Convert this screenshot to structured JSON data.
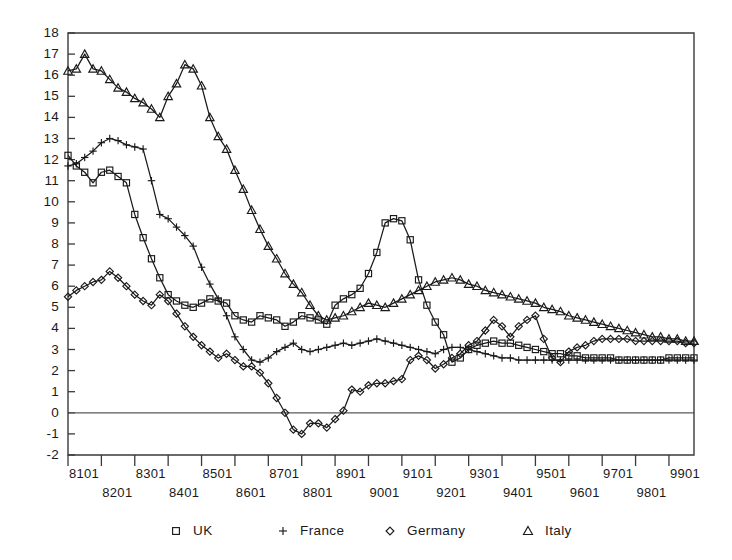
{
  "chart_data": {
    "type": "line",
    "title": "",
    "subtitle": "",
    "xlabel": "",
    "ylabel": "",
    "xlim": [
      0,
      75
    ],
    "ylim": [
      -2,
      18
    ],
    "grid": false,
    "legend_position": "bottom",
    "y_ticks": [
      -2,
      -1,
      0,
      1,
      2,
      3,
      4,
      5,
      6,
      7,
      8,
      9,
      10,
      11,
      12,
      13,
      14,
      15,
      16,
      17,
      18
    ],
    "y_tick_labels": [
      "-2",
      "-1",
      "0",
      "1",
      "2",
      "3",
      "4",
      "5",
      "6",
      "7",
      "8",
      "9",
      "10",
      "11",
      "12",
      "13",
      "14",
      "15",
      "16",
      "17",
      "18"
    ],
    "x_tick_labels_upper": [
      "8101",
      "8301",
      "8501",
      "8701",
      "8901",
      "9101",
      "9301",
      "9501",
      "9701",
      "9901"
    ],
    "x_tick_labels_lower": [
      "8201",
      "8401",
      "8601",
      "8801",
      "9001",
      "9201",
      "9401",
      "9601",
      "9801"
    ],
    "x_tick_index_upper": [
      0,
      8,
      16,
      24,
      32,
      40,
      48,
      56,
      64,
      72
    ],
    "x_tick_index_lower": [
      4,
      12,
      20,
      28,
      36,
      44,
      52,
      60,
      68
    ],
    "zero_line": 0,
    "point_count": 76,
    "series": [
      {
        "name": "UK",
        "marker": "square",
        "values": [
          12.2,
          11.7,
          11.4,
          10.9,
          11.4,
          11.5,
          11.2,
          10.9,
          9.4,
          8.3,
          7.3,
          6.4,
          5.6,
          5.3,
          5.1,
          5.0,
          5.2,
          5.4,
          5.3,
          5.2,
          4.6,
          4.4,
          4.3,
          4.6,
          4.5,
          4.4,
          4.1,
          4.3,
          4.6,
          4.5,
          4.4,
          4.2,
          5.1,
          5.4,
          5.6,
          5.9,
          6.6,
          7.6,
          9.0,
          9.2,
          9.1,
          8.2,
          6.3,
          5.1,
          4.3,
          3.7,
          2.4,
          2.6,
          3.0,
          3.2,
          3.3,
          3.4,
          3.3,
          3.3,
          3.2,
          3.1,
          3.0,
          2.9,
          2.8,
          2.8,
          2.7,
          2.7,
          2.6,
          2.6,
          2.6,
          2.6,
          2.5,
          2.5,
          2.5,
          2.5,
          2.5,
          2.5,
          2.6,
          2.6,
          2.6,
          2.6
        ]
      },
      {
        "name": "France",
        "marker": "plus",
        "values": [
          11.7,
          11.8,
          12.1,
          12.4,
          12.8,
          13.0,
          12.9,
          12.7,
          12.6,
          12.5,
          11.0,
          9.4,
          9.2,
          8.8,
          8.4,
          7.9,
          6.9,
          6.1,
          5.4,
          4.6,
          3.6,
          3.0,
          2.5,
          2.4,
          2.6,
          2.9,
          3.1,
          3.3,
          3.0,
          2.9,
          3.0,
          3.1,
          3.2,
          3.3,
          3.2,
          3.3,
          3.4,
          3.5,
          3.4,
          3.3,
          3.2,
          3.1,
          3.0,
          2.9,
          2.8,
          3.0,
          3.1,
          3.1,
          3.0,
          2.9,
          2.8,
          2.7,
          2.6,
          2.6,
          2.5,
          2.5,
          2.5,
          2.5,
          2.5,
          2.5,
          2.5,
          2.5,
          2.5,
          2.5,
          2.5,
          2.5,
          2.5,
          2.5,
          2.5,
          2.5,
          2.5,
          2.5,
          2.5,
          2.5,
          2.5,
          2.5
        ]
      },
      {
        "name": "Germany",
        "marker": "diamond",
        "values": [
          5.5,
          5.8,
          6.0,
          6.2,
          6.3,
          6.7,
          6.4,
          6.0,
          5.6,
          5.3,
          5.1,
          5.6,
          5.3,
          4.7,
          4.1,
          3.6,
          3.2,
          2.9,
          2.6,
          2.8,
          2.5,
          2.2,
          2.2,
          1.9,
          1.4,
          0.7,
          0.0,
          -0.8,
          -1.0,
          -0.5,
          -0.5,
          -0.7,
          -0.3,
          0.1,
          1.1,
          1.0,
          1.3,
          1.4,
          1.4,
          1.5,
          1.6,
          2.5,
          2.7,
          2.5,
          2.1,
          2.3,
          2.6,
          2.8,
          3.2,
          3.4,
          3.9,
          4.4,
          4.1,
          3.6,
          4.1,
          4.4,
          4.6,
          3.5,
          2.6,
          2.4,
          2.9,
          3.1,
          3.2,
          3.4,
          3.5,
          3.5,
          3.5,
          3.5,
          3.4,
          3.4,
          3.4,
          3.4,
          3.4,
          3.4,
          3.3,
          3.3
        ]
      },
      {
        "name": "Italy",
        "marker": "triangle",
        "values": [
          16.2,
          16.3,
          17.0,
          16.3,
          16.2,
          15.8,
          15.4,
          15.2,
          14.9,
          14.7,
          14.4,
          14.0,
          15.0,
          15.6,
          16.5,
          16.3,
          15.5,
          14.0,
          13.1,
          12.5,
          11.5,
          10.6,
          9.6,
          8.7,
          7.9,
          7.3,
          6.6,
          6.1,
          5.7,
          5.1,
          4.6,
          4.4,
          4.5,
          4.6,
          4.8,
          5.0,
          5.2,
          5.1,
          5.0,
          5.2,
          5.4,
          5.6,
          5.8,
          6.0,
          6.2,
          6.3,
          6.4,
          6.3,
          6.1,
          6.0,
          5.8,
          5.7,
          5.6,
          5.5,
          5.4,
          5.3,
          5.2,
          5.0,
          4.9,
          4.8,
          4.6,
          4.5,
          4.4,
          4.3,
          4.2,
          4.1,
          4.0,
          3.9,
          3.8,
          3.7,
          3.6,
          3.6,
          3.5,
          3.5,
          3.4,
          3.4
        ]
      }
    ]
  },
  "legend": {
    "items": [
      {
        "label": "UK",
        "marker": "square"
      },
      {
        "label": "France",
        "marker": "plus"
      },
      {
        "label": "Germany",
        "marker": "diamond"
      },
      {
        "label": "Italy",
        "marker": "triangle"
      }
    ]
  },
  "colors": {
    "ink": "#1a1a1a",
    "axis": "#3a3a3a",
    "background": "#ffffff"
  }
}
